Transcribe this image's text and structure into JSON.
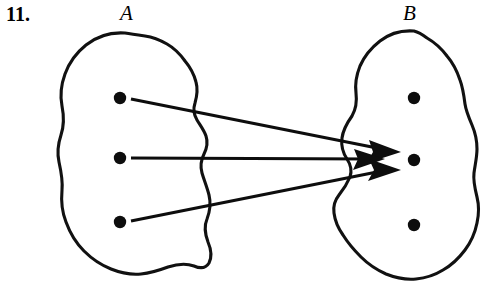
{
  "figure": {
    "problem_number": "11.",
    "caption_left": "A",
    "caption_right": "B",
    "ink_color": "#0d0d0d",
    "background_color": "#ffffff"
  },
  "sets": {
    "left": {
      "name": "A",
      "elements": [
        {
          "id": "a1",
          "x": 120,
          "y": 98
        },
        {
          "id": "a2",
          "x": 120,
          "y": 158
        },
        {
          "id": "a3",
          "x": 120,
          "y": 222
        }
      ],
      "outline_label": "set-a-blob"
    },
    "right": {
      "name": "B",
      "elements": [
        {
          "id": "b1",
          "x": 414,
          "y": 98
        },
        {
          "id": "b2",
          "x": 414,
          "y": 160
        },
        {
          "id": "b3",
          "x": 414,
          "y": 225
        }
      ],
      "outline_label": "set-b-blob"
    }
  },
  "mapping": {
    "type": "arrows",
    "description": "All three elements of A map to the middle element of B",
    "arrows": [
      {
        "id": "arrow-a1-b2",
        "from": "a1",
        "to": "b2",
        "x1": 131,
        "y1": 100,
        "x2": 400,
        "y2": 152
      },
      {
        "id": "arrow-a2-b2",
        "from": "a2",
        "to": "b2",
        "x1": 131,
        "y1": 158,
        "x2": 383,
        "y2": 160
      },
      {
        "id": "arrow-a3-b2",
        "from": "a3",
        "to": "b2",
        "x1": 131,
        "y1": 221,
        "x2": 400,
        "y2": 170
      }
    ]
  },
  "chart_data": {
    "type": "diagram",
    "domain_set": "A",
    "codomain_set": "B",
    "domain_elements": [
      "a1",
      "a2",
      "a3"
    ],
    "codomain_elements": [
      "b1",
      "b2",
      "b3"
    ],
    "edges": [
      {
        "source": "a1",
        "target": "b2"
      },
      {
        "source": "a2",
        "target": "b2"
      },
      {
        "source": "a3",
        "target": "b2"
      }
    ],
    "unmapped_codomain_elements": [
      "b1",
      "b3"
    ]
  }
}
